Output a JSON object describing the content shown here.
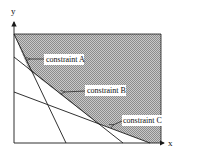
{
  "diagram": {
    "axes": {
      "x_label": "x",
      "y_label": "y"
    },
    "constraints": [
      {
        "id": "A",
        "label": "constraint A",
        "line": [
          [
            14,
            34
          ],
          [
            66,
            143
          ]
        ]
      },
      {
        "id": "B",
        "label": "constraint B",
        "line": [
          [
            14,
            57
          ],
          [
            123,
            143
          ]
        ]
      },
      {
        "id": "C",
        "label": "constraint C",
        "line": [
          [
            14,
            92
          ],
          [
            150,
            143
          ]
        ]
      }
    ],
    "feasible_region": {
      "fill": "#9a9a9a",
      "description": "shaded region above all constraints"
    },
    "colors": {
      "line": "#1a1a1a",
      "shade_dark": "#8c8c8c",
      "shade_light": "#c8c8c8",
      "label_bg": "#ffffff"
    }
  }
}
